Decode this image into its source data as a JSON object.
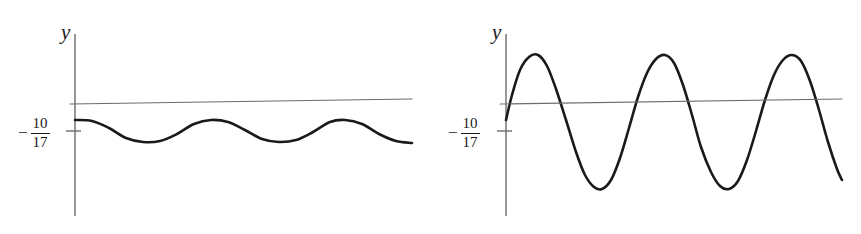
{
  "figure_pair": {
    "background_color": "#ffffff",
    "curve_color": "#1a1a1a",
    "axis_color": "#6b6b6b",
    "secant_color": "#6b6b6b",
    "panels": [
      {
        "id": "left",
        "name": "small-amplitude-graph",
        "axis_caption": "y",
        "tick_label": {
          "sign": "−",
          "numerator": "10",
          "denominator": "17"
        },
        "chart_data": {
          "type": "line",
          "title": "",
          "xlabel": "",
          "ylabel": "y",
          "grid": false,
          "legend": null,
          "axes": {
            "y_axis_x_px": 75,
            "y_axis_top_px": 34,
            "y_axis_bottom_px": 216,
            "tick_y_px": 131,
            "tick_label_value": "-10/17"
          },
          "series": [
            {
              "name": "oscillating-curve",
              "role": "function",
              "stroke_width": 2.6,
              "amplitude_px": 11,
              "midline_y_px": 131,
              "cycles": 5,
              "x_start_px": 75,
              "x_end_px": 412,
              "phase": "starts-at-maximum",
              "points": [
                [
                  75,
                  120
                ],
                [
                  92,
                  121
                ],
                [
                  109,
                  128
                ],
                [
                  126,
                  138
                ],
                [
                  143,
                  142
                ],
                [
                  160,
                  141
                ],
                [
                  177,
                  134
                ],
                [
                  194,
                  124
                ],
                [
                  211,
                  120
                ],
                [
                  228,
                  122
                ],
                [
                  245,
                  130
                ],
                [
                  262,
                  139
                ],
                [
                  279,
                  142
                ],
                [
                  296,
                  140
                ],
                [
                  313,
                  132
                ],
                [
                  330,
                  122
                ],
                [
                  345,
                  120
                ],
                [
                  362,
                  124
                ],
                [
                  379,
                  134
                ],
                [
                  396,
                  141
                ],
                [
                  412,
                  143
                ]
              ]
            },
            {
              "name": "secant-line",
              "role": "reference-line",
              "stroke_width": 1.1,
              "points": [
                [
                  70,
                  104
                ],
                [
                  412,
                  99
                ]
              ]
            }
          ],
          "xlim": [
            75,
            412
          ],
          "ylim": [
            34,
            216
          ]
        }
      },
      {
        "id": "right",
        "name": "large-amplitude-graph",
        "axis_caption": "y",
        "tick_label": {
          "sign": "−",
          "numerator": "10",
          "denominator": "17"
        },
        "chart_data": {
          "type": "line",
          "title": "",
          "xlabel": "",
          "ylabel": "y",
          "grid": false,
          "legend": null,
          "axes": {
            "y_axis_x_px": 76,
            "y_axis_top_px": 34,
            "y_axis_bottom_px": 216,
            "tick_y_px": 131,
            "tick_label_value": "-10/17"
          },
          "series": [
            {
              "name": "oscillating-curve",
              "role": "function",
              "stroke_width": 2.6,
              "amplitude_px": 67,
              "midline_y_px": 122,
              "cycles": 5,
              "x_start_px": 76,
              "x_end_px": 412,
              "phase": "starts-near-midline-rising",
              "points": [
                [
                  76,
                  120
                ],
                [
                  82,
                  95
                ],
                [
                  90,
                  70
                ],
                [
                  99,
                  57
                ],
                [
                  108,
                  55
                ],
                [
                  117,
                  66
                ],
                [
                  126,
                  89
                ],
                [
                  136,
                  120
                ],
                [
                  146,
                  152
                ],
                [
                  155,
                  175
                ],
                [
                  164,
                  187
                ],
                [
                  172,
                  189
                ],
                [
                  181,
                  180
                ],
                [
                  190,
                  158
                ],
                [
                  199,
                  128
                ],
                [
                  208,
                  97
                ],
                [
                  217,
                  73
                ],
                [
                  226,
                  59
                ],
                [
                  235,
                  55
                ],
                [
                  244,
                  63
                ],
                [
                  253,
                  85
                ],
                [
                  262,
                  115
                ],
                [
                  271,
                  147
                ],
                [
                  281,
                  172
                ],
                [
                  290,
                  186
                ],
                [
                  299,
                  189
                ],
                [
                  308,
                  181
                ],
                [
                  317,
                  160
                ],
                [
                  326,
                  131
                ],
                [
                  335,
                  100
                ],
                [
                  344,
                  75
                ],
                [
                  353,
                  60
                ],
                [
                  362,
                  55
                ],
                [
                  371,
                  61
                ],
                [
                  380,
                  81
                ],
                [
                  389,
                  110
                ],
                [
                  398,
                  142
                ],
                [
                  407,
                  169
                ],
                [
                  412,
                  180
                ]
              ]
            },
            {
              "name": "secant-line",
              "role": "reference-line",
              "stroke_width": 1.1,
              "points": [
                [
                  70,
                  104
                ],
                [
                  412,
                  99
                ]
              ]
            }
          ],
          "xlim": [
            76,
            412
          ],
          "ylim": [
            34,
            216
          ]
        }
      }
    ]
  }
}
